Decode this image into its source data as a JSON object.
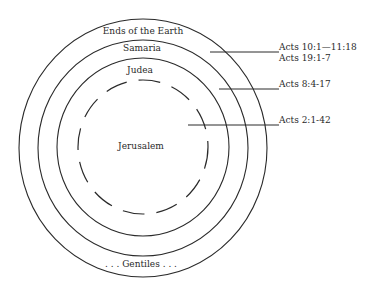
{
  "diagram": {
    "zones": [
      {
        "id": "ends-of-the-earth",
        "label": "Ends of the Earth"
      },
      {
        "id": "samaria",
        "label": "Samaria"
      },
      {
        "id": "judea",
        "label": "Judea"
      },
      {
        "id": "jerusalem",
        "label": "Jerusalem"
      }
    ],
    "bottom_label": ". . . Gentiles . . .",
    "references": [
      {
        "target": "ends-of-the-earth",
        "lines": [
          "Acts 10:1—11:18",
          "Acts 19:1-7"
        ]
      },
      {
        "target": "samaria",
        "lines": [
          "Acts 8:4-17"
        ]
      },
      {
        "target": "jerusalem",
        "lines": [
          "Acts 2:1-42"
        ]
      }
    ],
    "colors": {
      "line": "#2a2a2a",
      "background": "#ffffff"
    }
  }
}
